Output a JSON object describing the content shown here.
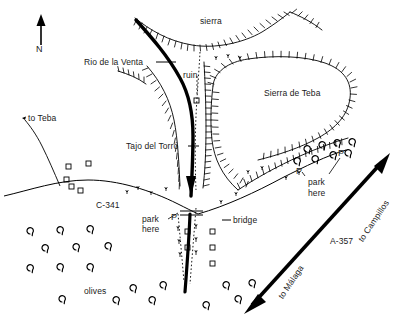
{
  "map": {
    "title_labels": {
      "north": "N",
      "sierra": "sierra",
      "sierra_de_teba": "Sierra de Teba",
      "ruin": "ruin",
      "rio_de_la_venta": "Rio de la Venta",
      "tajo_del_torro": "Tajo del Torró",
      "to_teba": "to Teba",
      "road_c341": "C-341",
      "road_a357": "A-357",
      "to_campillos": "to Campillos",
      "to_malaga": "to Málaga",
      "bridge": "bridge",
      "olives": "olives",
      "park_here_left": "park\nhere",
      "park_here_left_line1": "park",
      "park_here_left_line2": "here",
      "park_here_right_line1": "park",
      "park_here_right_line2": "here",
      "parking_marker_left": "P",
      "parking_marker_right_upper": "P",
      "parking_marker_right_lower": "P"
    },
    "colors": {
      "ink": "#1a1a1a",
      "background": "#ffffff",
      "line": "#000000"
    }
  }
}
